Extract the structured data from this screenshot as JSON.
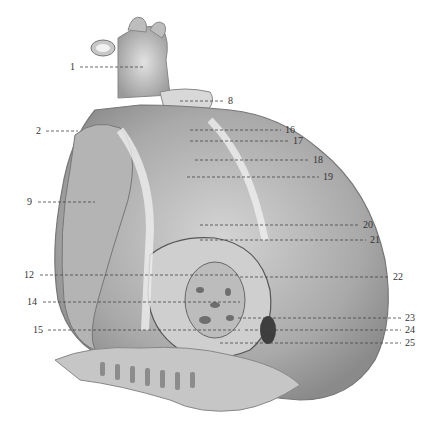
{
  "figure": {
    "labels": [
      {
        "id": "1",
        "x": 70,
        "y": 62,
        "lx1": 80,
        "lx2": 143,
        "ly": 67
      },
      {
        "id": "2",
        "x": 36,
        "y": 126,
        "lx1": 46,
        "lx2": 78,
        "ly": 131
      },
      {
        "id": "8",
        "x": 228,
        "y": 96,
        "lx1": 180,
        "lx2": 224,
        "ly": 101
      },
      {
        "id": "9",
        "x": 27,
        "y": 197,
        "lx1": 38,
        "lx2": 95,
        "ly": 202
      },
      {
        "id": "12",
        "x": 24,
        "y": 270,
        "lx1": 40,
        "lx2": 240,
        "ly": 275
      },
      {
        "id": "14",
        "x": 27,
        "y": 297,
        "lx1": 43,
        "lx2": 240,
        "ly": 302
      },
      {
        "id": "15",
        "x": 33,
        "y": 325,
        "lx1": 48,
        "lx2": 240,
        "ly": 330
      },
      {
        "id": "16",
        "x": 285,
        "y": 125,
        "lx1": 190,
        "lx2": 281,
        "ly": 130
      },
      {
        "id": "17",
        "x": 293,
        "y": 136,
        "lx1": 190,
        "lx2": 289,
        "ly": 141
      },
      {
        "id": "18",
        "x": 313,
        "y": 155,
        "lx1": 195,
        "lx2": 309,
        "ly": 160
      },
      {
        "id": "19",
        "x": 323,
        "y": 172,
        "lx1": 187,
        "lx2": 319,
        "ly": 177
      },
      {
        "id": "20",
        "x": 363,
        "y": 220,
        "lx1": 200,
        "lx2": 359,
        "ly": 225
      },
      {
        "id": "21",
        "x": 370,
        "y": 235,
        "lx1": 200,
        "lx2": 366,
        "ly": 240
      },
      {
        "id": "22",
        "x": 393,
        "y": 272,
        "lx1": 240,
        "lx2": 389,
        "ly": 277
      },
      {
        "id": "23",
        "x": 405,
        "y": 313,
        "lx1": 238,
        "lx2": 401,
        "ly": 318
      },
      {
        "id": "24",
        "x": 405,
        "y": 325,
        "lx1": 245,
        "lx2": 401,
        "ly": 330
      },
      {
        "id": "25",
        "x": 405,
        "y": 338,
        "lx1": 220,
        "lx2": 401,
        "ly": 343
      }
    ]
  }
}
